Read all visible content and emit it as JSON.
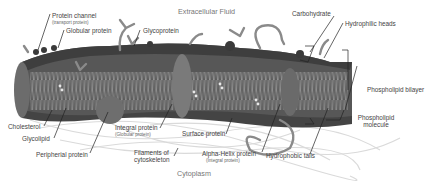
{
  "diagram": {
    "regions": {
      "top": "Extracellular Fluid",
      "bottom": "Cytoplasm"
    },
    "labels": {
      "protein_channel": "Protein channel",
      "protein_channel_sub": "(transport protein)",
      "globular_protein": "Globular protein",
      "glycoprotein": "Glycoprotein",
      "carbohydrate": "Carbohydrate",
      "hydrophilic_heads": "Hydrophilic heads",
      "phospholipid_bilayer": "Phospholipid bilayer",
      "phospholipid_molecule_1": "Phospholipid",
      "phospholipid_molecule_2": "molecule",
      "cholesterol": "Cholesterol",
      "glycolipid": "Glycolipid",
      "peripheral_protein": "Peripherial protein",
      "integral_protein": "Integral protein",
      "integral_protein_sub": "(Globular protein)",
      "filaments_1": "Filaments of",
      "filaments_2": "cytoskeleton",
      "surface_protein": "Surface protein",
      "alpha_helix": "Alpha-Helix protein",
      "alpha_helix_sub": "(Integral protein)",
      "hydrophobic_tails": "Hydrophobic tails"
    },
    "colors": {
      "membrane_dark": "#4a4a4a",
      "membrane_mid": "#6b6b6b",
      "protein": "#7a7a7a",
      "filament": "#d8d8d8",
      "label_text": "#444444",
      "leader_line": "#222222"
    }
  }
}
